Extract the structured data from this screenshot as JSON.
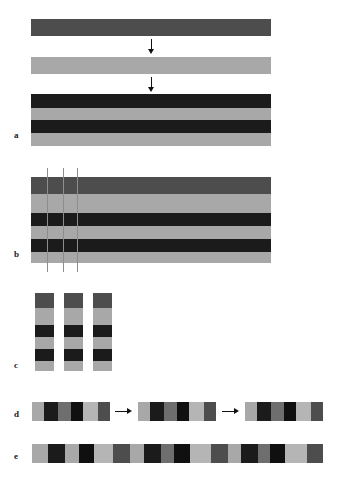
{
  "figure": {
    "caption_labels": [
      "a",
      "b",
      "c",
      "d",
      "e"
    ],
    "colors": {
      "dark_gray": "#4d4d4d",
      "mid_gray": "#6e6e6e",
      "light_gray": "#a8a8a8",
      "pale_gray": "#b5b5b5",
      "black": "#1b1b1b",
      "near_black": "#101010",
      "arrow": "#111111",
      "cut_line": "#8d8d8d",
      "background": "#ffffff"
    },
    "panels": {
      "a": {
        "label": "a",
        "label_x": 14,
        "label_y": 131,
        "bars": [
          {
            "name": "precursor-sheet-dark",
            "x": 31,
            "y": 19,
            "width": 240,
            "height": 17,
            "layers": [
              {
                "name": "dark-sheet",
                "color": "#4d4d4d",
                "height": 17
              }
            ]
          },
          {
            "name": "precursor-sheet-light",
            "x": 31,
            "y": 57,
            "width": 240,
            "height": 17,
            "layers": [
              {
                "name": "light-sheet",
                "color": "#a8a8a8",
                "height": 17
              }
            ]
          },
          {
            "name": "stacked-laminate",
            "x": 31,
            "y": 94,
            "width": 240,
            "height": 52,
            "layers": [
              {
                "name": "layer-1-dark",
                "color": "#1b1b1b",
                "height": 14
              },
              {
                "name": "layer-2-light",
                "color": "#a8a8a8",
                "height": 12
              },
              {
                "name": "layer-3-dark",
                "color": "#1b1b1b",
                "height": 13
              },
              {
                "name": "layer-4-light",
                "color": "#a8a8a8",
                "height": 13
              }
            ]
          }
        ],
        "arrows": [
          {
            "name": "arrow-step-1",
            "x": 147,
            "y": 39,
            "length": 15
          },
          {
            "name": "arrow-step-2",
            "x": 147,
            "y": 77,
            "length": 15
          }
        ]
      },
      "b": {
        "label": "b",
        "label_x": 14,
        "label_y": 250,
        "bar": {
          "name": "pressed-laminate",
          "x": 31,
          "y": 177,
          "width": 240,
          "height": 86,
          "layers": [
            {
              "name": "layer-1-dark-gray",
              "color": "#4d4d4d",
              "height": 17
            },
            {
              "name": "layer-2-light-gray",
              "color": "#a8a8a8",
              "height": 19
            },
            {
              "name": "layer-3-black",
              "color": "#1b1b1b",
              "height": 13
            },
            {
              "name": "layer-4-light-gray",
              "color": "#a8a8a8",
              "height": 13
            },
            {
              "name": "layer-5-black",
              "color": "#1b1b1b",
              "height": 13
            },
            {
              "name": "layer-6-light-gray",
              "color": "#a8a8a8",
              "height": 11
            }
          ]
        },
        "cut_lines": [
          {
            "name": "cut-line-1",
            "x": 47,
            "y": 168,
            "height": 104
          },
          {
            "name": "cut-line-2",
            "x": 63,
            "y": 168,
            "height": 104
          },
          {
            "name": "cut-line-3",
            "x": 77,
            "y": 168,
            "height": 104
          }
        ]
      },
      "c": {
        "label": "c",
        "label_x": 14,
        "label_y": 361,
        "strips": [
          {
            "name": "cut-strip-1",
            "x": 35,
            "y": 293,
            "width": 19,
            "height": 78,
            "segments": [
              {
                "name": "seg-1",
                "color": "#4d4d4d",
                "height": 15
              },
              {
                "name": "seg-2",
                "color": "#a8a8a8",
                "height": 17
              },
              {
                "name": "seg-3",
                "color": "#1b1b1b",
                "height": 12
              },
              {
                "name": "seg-4",
                "color": "#a8a8a8",
                "height": 12
              },
              {
                "name": "seg-5",
                "color": "#1b1b1b",
                "height": 12
              },
              {
                "name": "seg-6",
                "color": "#a8a8a8",
                "height": 10
              }
            ]
          },
          {
            "name": "cut-strip-2",
            "x": 64,
            "y": 293,
            "width": 19,
            "height": 78,
            "segments": [
              {
                "name": "seg-1",
                "color": "#4d4d4d",
                "height": 15
              },
              {
                "name": "seg-2",
                "color": "#a8a8a8",
                "height": 17
              },
              {
                "name": "seg-3",
                "color": "#1b1b1b",
                "height": 12
              },
              {
                "name": "seg-4",
                "color": "#a8a8a8",
                "height": 12
              },
              {
                "name": "seg-5",
                "color": "#1b1b1b",
                "height": 12
              },
              {
                "name": "seg-6",
                "color": "#a8a8a8",
                "height": 10
              }
            ]
          },
          {
            "name": "cut-strip-3",
            "x": 93,
            "y": 293,
            "width": 19,
            "height": 78,
            "segments": [
              {
                "name": "seg-1",
                "color": "#4d4d4d",
                "height": 15
              },
              {
                "name": "seg-2",
                "color": "#a8a8a8",
                "height": 17
              },
              {
                "name": "seg-3",
                "color": "#1b1b1b",
                "height": 12
              },
              {
                "name": "seg-4",
                "color": "#a8a8a8",
                "height": 12
              },
              {
                "name": "seg-5",
                "color": "#1b1b1b",
                "height": 12
              },
              {
                "name": "seg-6",
                "color": "#a8a8a8",
                "height": 10
              }
            ]
          }
        ]
      },
      "d": {
        "label": "d",
        "label_x": 14,
        "label_y": 410,
        "rows": [
          {
            "name": "rotated-strip-group-1",
            "x": 32,
            "y": 402,
            "width": 78,
            "height": 19,
            "segments": [
              {
                "name": "seg-1",
                "color": "#a8a8a8",
                "width": 12
              },
              {
                "name": "seg-2",
                "color": "#1b1b1b",
                "width": 14
              },
              {
                "name": "seg-3",
                "color": "#6e6e6e",
                "width": 13
              },
              {
                "name": "seg-4",
                "color": "#101010",
                "width": 12
              },
              {
                "name": "seg-5",
                "color": "#b5b5b5",
                "width": 15
              },
              {
                "name": "seg-6",
                "color": "#4d4d4d",
                "width": 12
              }
            ]
          },
          {
            "name": "rotated-strip-group-2",
            "x": 138,
            "y": 402,
            "width": 78,
            "height": 19,
            "segments": [
              {
                "name": "seg-1",
                "color": "#a8a8a8",
                "width": 12
              },
              {
                "name": "seg-2",
                "color": "#1b1b1b",
                "width": 14
              },
              {
                "name": "seg-3",
                "color": "#6e6e6e",
                "width": 13
              },
              {
                "name": "seg-4",
                "color": "#101010",
                "width": 12
              },
              {
                "name": "seg-5",
                "color": "#b5b5b5",
                "width": 15
              },
              {
                "name": "seg-6",
                "color": "#4d4d4d",
                "width": 12
              }
            ]
          },
          {
            "name": "rotated-strip-group-3",
            "x": 245,
            "y": 402,
            "width": 78,
            "height": 19,
            "segments": [
              {
                "name": "seg-1",
                "color": "#a8a8a8",
                "width": 12
              },
              {
                "name": "seg-2",
                "color": "#1b1b1b",
                "width": 14
              },
              {
                "name": "seg-3",
                "color": "#6e6e6e",
                "width": 13
              },
              {
                "name": "seg-4",
                "color": "#101010",
                "width": 12
              },
              {
                "name": "seg-5",
                "color": "#b5b5b5",
                "width": 15
              },
              {
                "name": "seg-6",
                "color": "#4d4d4d",
                "width": 12
              }
            ]
          }
        ],
        "arrows": [
          {
            "name": "arrow-transfer-1",
            "x": 115,
            "y": 407,
            "length": 17
          },
          {
            "name": "arrow-transfer-2",
            "x": 222,
            "y": 407,
            "length": 17
          }
        ]
      },
      "e": {
        "label": "e",
        "label_x": 14,
        "label_y": 452,
        "row": {
          "name": "assembled-final-array",
          "x": 32,
          "y": 444,
          "width": 291,
          "height": 19,
          "segments": [
            {
              "name": "seg-1",
              "color": "#a8a8a8",
              "width": 16
            },
            {
              "name": "seg-2",
              "color": "#1b1b1b",
              "width": 17
            },
            {
              "name": "seg-3",
              "color": "#a8a8a8",
              "width": 14
            },
            {
              "name": "seg-4",
              "color": "#101010",
              "width": 15
            },
            {
              "name": "seg-5",
              "color": "#b5b5b5",
              "width": 19
            },
            {
              "name": "seg-6",
              "color": "#4d4d4d",
              "width": 17
            },
            {
              "name": "seg-7",
              "color": "#a8a8a8",
              "width": 14
            },
            {
              "name": "seg-8",
              "color": "#1b1b1b",
              "width": 17
            },
            {
              "name": "seg-9",
              "color": "#6e6e6e",
              "width": 13
            },
            {
              "name": "seg-10",
              "color": "#101010",
              "width": 16
            },
            {
              "name": "seg-11",
              "color": "#b5b5b5",
              "width": 21
            },
            {
              "name": "seg-12",
              "color": "#4d4d4d",
              "width": 17
            },
            {
              "name": "seg-13",
              "color": "#a8a8a8",
              "width": 13
            },
            {
              "name": "seg-14",
              "color": "#1b1b1b",
              "width": 17
            },
            {
              "name": "seg-15",
              "color": "#6e6e6e",
              "width": 12
            },
            {
              "name": "seg-16",
              "color": "#101010",
              "width": 15
            },
            {
              "name": "seg-17",
              "color": "#b5b5b5",
              "width": 22
            },
            {
              "name": "seg-18",
              "color": "#4d4d4d",
              "width": 16
            }
          ]
        }
      }
    }
  }
}
